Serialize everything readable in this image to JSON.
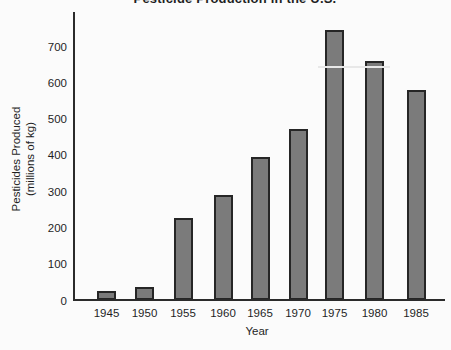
{
  "chart_data": {
    "type": "bar",
    "title": "Pesticide Production in the U.S.",
    "categories": [
      "1945",
      "1950",
      "1955",
      "1960",
      "1965",
      "1970",
      "1975",
      "1980",
      "1985"
    ],
    "values": [
      25,
      35,
      225,
      290,
      395,
      470,
      745,
      660,
      580
    ],
    "xlabel": "Year",
    "ylabel_line1": "Pesticides Produced",
    "ylabel_line2": "(millions of kg)",
    "yticks": [
      0,
      100,
      200,
      300,
      400,
      500,
      600,
      700
    ],
    "ylim": [
      0,
      790
    ],
    "grid": "off",
    "legend": "none",
    "colors": {
      "bar_fill": "#7b7b7b",
      "bar_border": "#262626",
      "axis": "#2b2b2b",
      "text": "#1f1f1f",
      "background": "#fbfbfb",
      "scan_artifact": "#e8e8e8"
    }
  }
}
